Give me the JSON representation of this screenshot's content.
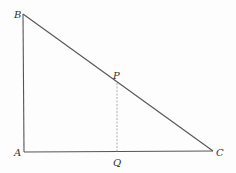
{
  "figure": {
    "stroke_color": "#555555",
    "dash_color": "#999999",
    "points": {
      "A": {
        "label": "A",
        "x": 24,
        "y": 152
      },
      "B": {
        "label": "B",
        "x": 23,
        "y": 14
      },
      "C": {
        "label": "C",
        "x": 213,
        "y": 151
      },
      "P": {
        "label": "P",
        "x": 117,
        "y": 82
      },
      "Q": {
        "label": "Q",
        "x": 117,
        "y": 152
      }
    },
    "segments": [
      {
        "from": "A",
        "to": "B",
        "style": "solid"
      },
      {
        "from": "B",
        "to": "C",
        "style": "solid"
      },
      {
        "from": "A",
        "to": "C",
        "style": "solid"
      },
      {
        "from": "P",
        "to": "Q",
        "style": "dashed"
      }
    ]
  }
}
